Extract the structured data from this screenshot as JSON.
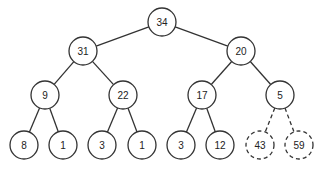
{
  "diagram": {
    "type": "binary-tree",
    "nodes": [
      {
        "id": "n0",
        "label": "34",
        "x": 162,
        "y": 22,
        "dashed": false
      },
      {
        "id": "n1",
        "label": "31",
        "x": 83,
        "y": 51,
        "dashed": false
      },
      {
        "id": "n2",
        "label": "20",
        "x": 241,
        "y": 51,
        "dashed": false
      },
      {
        "id": "n3",
        "label": "9",
        "x": 45,
        "y": 95,
        "dashed": false
      },
      {
        "id": "n4",
        "label": "22",
        "x": 123,
        "y": 95,
        "dashed": false
      },
      {
        "id": "n5",
        "label": "17",
        "x": 202,
        "y": 95,
        "dashed": false
      },
      {
        "id": "n6",
        "label": "5",
        "x": 280,
        "y": 95,
        "dashed": false
      },
      {
        "id": "n7",
        "label": "8",
        "x": 24,
        "y": 145,
        "dashed": false
      },
      {
        "id": "n8",
        "label": "1",
        "x": 63,
        "y": 145,
        "dashed": false
      },
      {
        "id": "n9",
        "label": "3",
        "x": 102,
        "y": 145,
        "dashed": false
      },
      {
        "id": "n10",
        "label": "1",
        "x": 142,
        "y": 145,
        "dashed": false
      },
      {
        "id": "n11",
        "label": "3",
        "x": 181,
        "y": 145,
        "dashed": false
      },
      {
        "id": "n12",
        "label": "12",
        "x": 220,
        "y": 145,
        "dashed": false
      },
      {
        "id": "n13",
        "label": "43",
        "x": 260,
        "y": 145,
        "dashed": true
      },
      {
        "id": "n14",
        "label": "59",
        "x": 299,
        "y": 145,
        "dashed": true
      }
    ],
    "edges": [
      {
        "from": "n0",
        "to": "n1",
        "dashed": false
      },
      {
        "from": "n0",
        "to": "n2",
        "dashed": false
      },
      {
        "from": "n1",
        "to": "n3",
        "dashed": false
      },
      {
        "from": "n1",
        "to": "n4",
        "dashed": false
      },
      {
        "from": "n2",
        "to": "n5",
        "dashed": false
      },
      {
        "from": "n2",
        "to": "n6",
        "dashed": false
      },
      {
        "from": "n3",
        "to": "n7",
        "dashed": false
      },
      {
        "from": "n3",
        "to": "n8",
        "dashed": false
      },
      {
        "from": "n4",
        "to": "n9",
        "dashed": false
      },
      {
        "from": "n4",
        "to": "n10",
        "dashed": false
      },
      {
        "from": "n5",
        "to": "n11",
        "dashed": false
      },
      {
        "from": "n5",
        "to": "n12",
        "dashed": false
      },
      {
        "from": "n6",
        "to": "n13",
        "dashed": true
      },
      {
        "from": "n6",
        "to": "n14",
        "dashed": true
      }
    ],
    "node_radius": 14
  }
}
